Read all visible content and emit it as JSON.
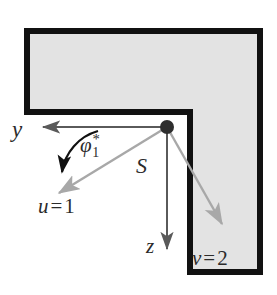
{
  "figure": {
    "colors": {
      "background": "#ffffff",
      "body_fill": "#e3e3e3",
      "body_outline": "#111111",
      "gray_arrow": "#a8a8a8",
      "dark_arrow": "#5a5a5a",
      "black_arrow": "#111111",
      "node": "#2e2e2e",
      "text": "#2b2b2b"
    },
    "shape": {
      "name": "L-shaped-domain",
      "outline_width_px": 6,
      "vertices": [
        [
          27,
          31
        ],
        [
          260,
          31
        ],
        [
          260,
          272
        ],
        [
          190,
          272
        ],
        [
          190,
          112
        ],
        [
          27,
          112
        ]
      ]
    },
    "node": {
      "name": "corner-node",
      "x": 167,
      "y": 127,
      "radius": 7
    }
  },
  "axes": [
    {
      "id": "y-axis",
      "label": "y",
      "from": [
        167,
        127
      ],
      "to": [
        38,
        127
      ],
      "color": "#5a5a5a",
      "head": "solid"
    },
    {
      "id": "z-axis",
      "label": "z",
      "from": [
        167,
        127
      ],
      "to": [
        167,
        256
      ],
      "color": "#5a5a5a",
      "head": "solid"
    },
    {
      "id": "u-axis",
      "label_parts": {
        "symbol": "u",
        "relation": "=",
        "value": "1"
      },
      "label": "u = 1",
      "from": [
        167,
        127
      ],
      "to": [
        55,
        196
      ],
      "color": "#a8a8a8",
      "head": "solid"
    },
    {
      "id": "v-axis",
      "label_parts": {
        "symbol": "v",
        "relation": "=",
        "value": "2"
      },
      "label": "v = 2",
      "from": [
        167,
        127
      ],
      "to": [
        226,
        229
      ],
      "color": "#a8a8a8",
      "head": "solid"
    }
  ],
  "labels": {
    "y": "y",
    "z": "z",
    "s": "S",
    "phi": {
      "symbol": "φ",
      "subscript": "1",
      "superscript": "*"
    },
    "u_symbol": "u",
    "u_relation": "=",
    "u_value": "1",
    "v_symbol": "v",
    "v_relation": "=",
    "v_value": "2"
  },
  "angle_arc": {
    "name": "phi-angle-arc",
    "from_axis": "y-axis",
    "to_axis": "u-axis",
    "color": "#111111",
    "label": "φ₁*"
  }
}
